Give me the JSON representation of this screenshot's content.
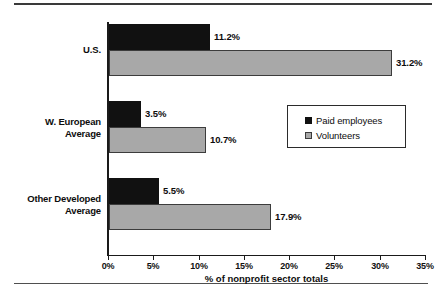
{
  "chart_data": {
    "type": "bar",
    "orientation": "horizontal",
    "title": "",
    "xlabel": "% of nonprofit sector totals",
    "ylabel": "",
    "categories": [
      "U.S.",
      "W. European Average",
      "Other Developed Average"
    ],
    "category_lines": [
      [
        "U.S."
      ],
      [
        "W. European",
        "Average"
      ],
      [
        "Other Developed",
        "Average"
      ]
    ],
    "series": [
      {
        "name": "Paid employees",
        "color": "#111111",
        "values": [
          11.2,
          3.5,
          5.5
        ],
        "labels": [
          "11.2%",
          "3.5%",
          "5.5%"
        ]
      },
      {
        "name": "Volunteers",
        "color": "#a8a8a8",
        "values": [
          31.2,
          10.7,
          17.9
        ],
        "labels": [
          "31.2%",
          "10.7%",
          "17.9%"
        ]
      }
    ],
    "xlim": [
      0,
      35
    ],
    "xticks": [
      0,
      5,
      10,
      15,
      20,
      25,
      30,
      35
    ],
    "xticklabels": [
      "0%",
      "5%",
      "10%",
      "15%",
      "20%",
      "25%",
      "30%",
      "35%"
    ],
    "grid": false,
    "legend_position": "center-right",
    "legend_entries": [
      "Paid employees",
      "Volunteers"
    ]
  },
  "figure": {
    "top_rule": "horizontal-rule",
    "bottom_rule": "horizontal-rule",
    "axis_line_color": "#1a1a1a"
  }
}
